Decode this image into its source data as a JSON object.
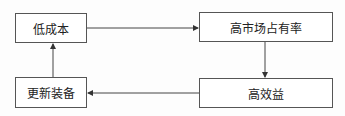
{
  "diagram": {
    "type": "cycle-flowchart",
    "nodes": [
      {
        "id": "low-cost",
        "label": "低成本"
      },
      {
        "id": "high-market-share",
        "label": "高市场占有率"
      },
      {
        "id": "high-profit",
        "label": "高效益"
      },
      {
        "id": "update-equipment",
        "label": "更新装备"
      }
    ],
    "edges": [
      {
        "from": "low-cost",
        "to": "high-market-share"
      },
      {
        "from": "high-market-share",
        "to": "high-profit"
      },
      {
        "from": "high-profit",
        "to": "update-equipment"
      },
      {
        "from": "update-equipment",
        "to": "low-cost"
      }
    ],
    "colors": {
      "stroke": "#555555",
      "text": "#222222",
      "background": "#ffffff"
    }
  }
}
